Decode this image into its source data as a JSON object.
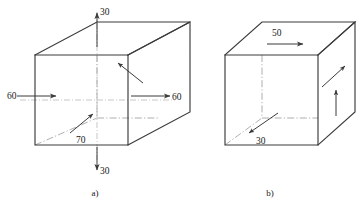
{
  "figure": {
    "background_color": "#ffffff",
    "line_color": "#3b3b3b",
    "hidden_line_color": "#9a9a9a"
  },
  "diagrams": [
    {
      "id": "a",
      "caption": "a)",
      "loads": [
        {
          "name": "top-load",
          "value": "30",
          "direction": "up"
        },
        {
          "name": "bottom-load",
          "value": "30",
          "direction": "down"
        },
        {
          "name": "left-load",
          "value": "60",
          "direction": "right"
        },
        {
          "name": "right-load",
          "value": "60",
          "direction": "right"
        },
        {
          "name": "depth-load",
          "value": "70",
          "direction": "diagonal-up-right"
        },
        {
          "name": "right-face-load",
          "value": "",
          "direction": "diagonal-up-right"
        }
      ]
    },
    {
      "id": "b",
      "caption": "b)",
      "loads": [
        {
          "name": "top-load",
          "value": "50",
          "direction": "right"
        },
        {
          "name": "depth-load",
          "value": "30",
          "direction": "diagonal-down-left"
        },
        {
          "name": "right-face-load",
          "value": "",
          "direction": "diagonal-up-right"
        },
        {
          "name": "right-vertical-load",
          "value": "",
          "direction": "up"
        }
      ]
    }
  ],
  "labels": {
    "a_top": "30",
    "a_bottom": "30",
    "a_left": "60",
    "a_right": "60",
    "a_depth": "70",
    "b_top": "50",
    "b_depth": "30",
    "caption_a": "a)",
    "caption_b": "b)"
  }
}
